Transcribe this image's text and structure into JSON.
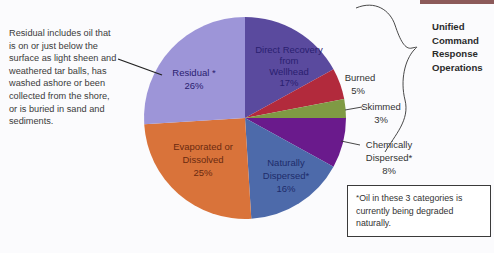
{
  "chart_data": {
    "type": "pie",
    "title": "",
    "slices": [
      {
        "label": "Direct Recovery from Wellhead",
        "value": 17,
        "color": "#5a4a9e",
        "label_color": "#2a2070",
        "asterisk": false
      },
      {
        "label": "Burned",
        "value": 5,
        "color": "#b22a3c",
        "label_color": "#333333",
        "asterisk": false
      },
      {
        "label": "Skimmed",
        "value": 3,
        "color": "#7f9a44",
        "label_color": "#333333",
        "asterisk": false
      },
      {
        "label": "Chemically Dispersed",
        "value": 8,
        "color": "#6a1a8c",
        "label_color": "#333333",
        "asterisk": true
      },
      {
        "label": "Naturally Dispersed",
        "value": 16,
        "color": "#4d6aaa",
        "label_color": "#1e2c6a",
        "asterisk": true
      },
      {
        "label": "Evaporated or Dissolved",
        "value": 25,
        "color": "#d9733a",
        "label_color": "#6a2a10",
        "asterisk": false
      },
      {
        "label": "Residual",
        "value": 26,
        "color": "#9d95d8",
        "label_color": "#2a2070",
        "asterisk": true
      }
    ],
    "annotations": [
      "Residual includes oil that is on or just below the surface as light sheen and weathered tar balls, has washed ashore or been collected from the shore, or is buried in sand and sediments.",
      "Unified Command Response Operations",
      "*Oil in these 3 categories is currently being degraded naturally."
    ]
  },
  "labels": {
    "direct_1": "Direct Recovery",
    "direct_2": "from",
    "direct_3": "Wellhead",
    "direct_pct": "17%",
    "burned": "Burned",
    "burned_pct": "5%",
    "skimmed": "Skimmed",
    "skimmed_pct": "3%",
    "chem_1": "Chemically",
    "chem_2": "Dispersed*",
    "chem_pct": "8%",
    "nat_1": "Naturally",
    "nat_2": "Dispersed*",
    "nat_pct": "16%",
    "evap_1": "Evaporated or",
    "evap_2": "Dissolved",
    "evap_pct": "25%",
    "res_1": "Residual *",
    "res_pct": "26%"
  },
  "description": "Residual includes oil that is on or just below the surface as light sheen and weathered tar balls, has washed ashore or been collected from the shore, or is buried in sand and sediments.",
  "bracket_label": [
    "Unified",
    "Command",
    "Response",
    "Operations"
  ],
  "note": {
    "asterisk": "*",
    "text": "Oil in these 3 categories is currently being degraded naturally."
  }
}
